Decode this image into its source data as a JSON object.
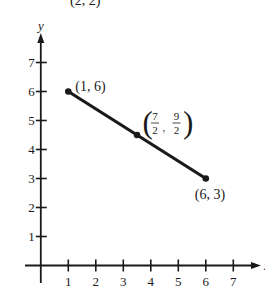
{
  "chart_data": {
    "type": "line",
    "title": "",
    "xlabel": "x",
    "ylabel": "y",
    "xlim": [
      0,
      7.5
    ],
    "ylim": [
      0,
      7.5
    ],
    "grid": false,
    "x_ticks": [
      1,
      2,
      3,
      4,
      5,
      6,
      7
    ],
    "y_ticks": [
      1,
      2,
      3,
      4,
      5,
      6,
      7
    ],
    "series": [
      {
        "name": "segment",
        "points": [
          {
            "x": 1,
            "y": 6,
            "label": "(1,  6)"
          },
          {
            "x": 3.5,
            "y": 4.5,
            "label": "(7/2, 9/2)",
            "label_frac": {
              "x_num": "7",
              "x_den": "2",
              "y_num": "9",
              "y_den": "2"
            }
          },
          {
            "x": 6,
            "y": 3,
            "label": "(6,  3)"
          }
        ]
      }
    ],
    "annotations": [
      {
        "text": "(2, 2)",
        "note": "clipped at top edge"
      }
    ]
  },
  "style": {
    "ink": "#1a1a1a",
    "background": "#ffffff"
  }
}
